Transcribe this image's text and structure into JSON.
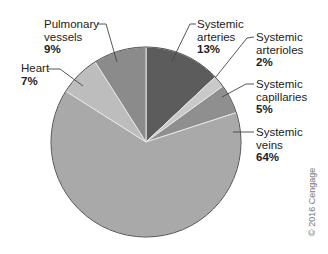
{
  "chart_data": {
    "type": "pie",
    "title": "",
    "start_angle_deg": 0,
    "direction": "clockwise",
    "slices": [
      {
        "label_line1": "Systemic",
        "label_line2": "arteries",
        "label": "Systemic arteries",
        "value": 13,
        "pct_text": "13%",
        "color": "#5c5c5c"
      },
      {
        "label_line1": "Systemic",
        "label_line2": "arterioles",
        "label": "Systemic arterioles",
        "value": 2,
        "pct_text": "2%",
        "color": "#c9c9c9"
      },
      {
        "label_line1": "Systemic",
        "label_line2": "capillaries",
        "label": "Systemic capillaries",
        "value": 5,
        "pct_text": "5%",
        "color": "#8f8f8f"
      },
      {
        "label_line1": "Systemic",
        "label_line2": "veins",
        "label": "Systemic veins",
        "value": 64,
        "pct_text": "64%",
        "color": "#a9a9a9"
      },
      {
        "label_line1": "Heart",
        "label_line2": "",
        "label": "Heart",
        "value": 7,
        "pct_text": "7%",
        "color": "#bdbdbd"
      },
      {
        "label_line1": "Pulmonary",
        "label_line2": "vessels",
        "label": "Pulmonary vessels",
        "value": 9,
        "pct_text": "9%",
        "color": "#8b8b8b"
      }
    ],
    "legend": "none (direct labels with leader lines)"
  },
  "copyright": "© 2016 Cengage"
}
